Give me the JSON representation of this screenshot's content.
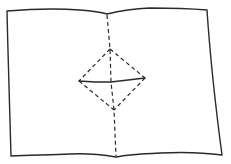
{
  "diagram": {
    "type": "paper-fold-pattern",
    "colors": {
      "background": "#ffffff",
      "ink": "#2a2a2a"
    },
    "elements": {
      "sheet_outline": {
        "style": "solid",
        "points": [
          [
            7,
            10
          ],
          [
            60,
            8
          ],
          [
            107,
            14
          ],
          [
            150,
            8
          ],
          [
            207,
            10
          ],
          [
            222,
            155
          ],
          [
            170,
            153
          ],
          [
            116,
            157
          ],
          [
            60,
            154
          ],
          [
            11,
            156
          ]
        ]
      },
      "center_fold": {
        "style": "dashed",
        "from": [
          107,
          14
        ],
        "to": [
          116,
          157
        ]
      },
      "diamond_folds": {
        "style": "dashed",
        "top": [
          110,
          49
        ],
        "left": [
          79,
          81
        ],
        "right": [
          145,
          78
        ],
        "bottom": [
          114,
          110
        ]
      },
      "horizontal_cut": {
        "style": "solid",
        "points": [
          [
            79,
            81
          ],
          [
            111,
            82
          ],
          [
            145,
            78
          ]
        ]
      }
    }
  }
}
